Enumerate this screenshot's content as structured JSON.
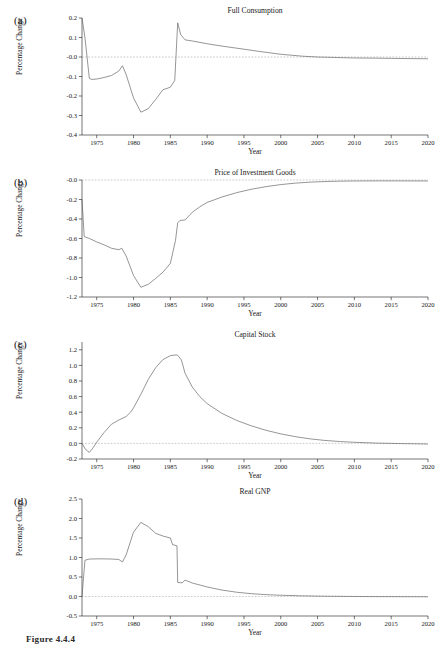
{
  "figure": {
    "caption": "Figure 4.4.4"
  },
  "panels": [
    {
      "letter": "(a)",
      "title": "Full Consumption",
      "xlabel": "Year",
      "ylabel": "Percentage Change"
    },
    {
      "letter": "(b)",
      "title": "Price of Investment Goods",
      "xlabel": "Year",
      "ylabel": "Percentage Change"
    },
    {
      "letter": "(c)",
      "title": "Capital Stock",
      "xlabel": "Year",
      "ylabel": "Percentage Change"
    },
    {
      "letter": "(d)",
      "title": "Real GNP",
      "xlabel": "Year",
      "ylabel": "Percentage Change"
    }
  ],
  "chart_data": [
    {
      "type": "line",
      "panel": "(a)",
      "title": "Full Consumption",
      "xlabel": "Year",
      "ylabel": "Percentage Change",
      "xlim": [
        1973,
        2020
      ],
      "ylim": [
        -0.4,
        0.2
      ],
      "xticks": [
        1975,
        1980,
        1985,
        1990,
        1995,
        2000,
        2005,
        2010,
        2015,
        2020
      ],
      "xticklabels": [
        "1975",
        "1980",
        "1985",
        "1990",
        "1995",
        "2000",
        "2005",
        "2010",
        "2015",
        "2020"
      ],
      "yticks": [
        0.2,
        0.1,
        -0.0,
        -0.1,
        -0.2,
        -0.3,
        -0.4
      ],
      "yticklabels": [
        "0.2",
        "0.1",
        "-0.0",
        "-0.1",
        "-0.2",
        "-0.3",
        "-0.4"
      ],
      "grid": false,
      "legend": false,
      "zero_reference_line": 0.0,
      "x": [
        1973,
        1973.4,
        1974,
        1974.3,
        1975,
        1976,
        1977,
        1978,
        1978.5,
        1979,
        1980,
        1981,
        1982,
        1983,
        1984,
        1985,
        1985.6,
        1986,
        1986.4,
        1987,
        1988,
        1990,
        1992,
        1995,
        1997,
        2000,
        2003,
        2005,
        2008,
        2010,
        2013,
        2015,
        2017,
        2020
      ],
      "y": [
        0.2,
        0.1,
        -0.11,
        -0.115,
        -0.113,
        -0.105,
        -0.095,
        -0.072,
        -0.045,
        -0.09,
        -0.21,
        -0.283,
        -0.265,
        -0.218,
        -0.168,
        -0.155,
        -0.12,
        0.175,
        0.115,
        0.088,
        0.082,
        0.068,
        0.056,
        0.04,
        0.029,
        0.014,
        0.004,
        0.0,
        -0.003,
        -0.005,
        -0.006,
        -0.007,
        -0.008,
        -0.009
      ]
    },
    {
      "type": "line",
      "panel": "(b)",
      "title": "Price of Investment Goods",
      "xlabel": "Year",
      "ylabel": "Percentage Change",
      "xlim": [
        1973,
        2020
      ],
      "ylim": [
        -1.2,
        0.0
      ],
      "xticks": [
        1975,
        1980,
        1985,
        1990,
        1995,
        2000,
        2005,
        2010,
        2015,
        2020
      ],
      "xticklabels": [
        "1975",
        "1980",
        "1985",
        "1990",
        "1995",
        "2000",
        "2005",
        "2010",
        "2015",
        "2020"
      ],
      "yticks": [
        -0.0,
        -0.2,
        -0.4,
        -0.6,
        -0.8,
        -1.0,
        -1.2
      ],
      "yticklabels": [
        "-0.0",
        "-0.2",
        "-0.4",
        "-0.6",
        "-0.8",
        "-1.0",
        "-1.2"
      ],
      "grid": false,
      "legend": false,
      "zero_reference_line": 0.0,
      "x": [
        1973,
        1973.3,
        1974,
        1975,
        1976,
        1977,
        1978,
        1978.4,
        1979,
        1980,
        1981,
        1982,
        1983,
        1984,
        1985,
        1985.7,
        1986,
        1986.3,
        1987,
        1988,
        1989,
        1990,
        1992,
        1994,
        1996,
        1998,
        2000,
        2002,
        2004,
        2006,
        2008,
        2010,
        2013,
        2016,
        2020
      ],
      "y": [
        -0.2,
        -0.58,
        -0.6,
        -0.635,
        -0.665,
        -0.7,
        -0.715,
        -0.7,
        -0.78,
        -0.98,
        -1.1,
        -1.07,
        -1.01,
        -0.945,
        -0.855,
        -0.62,
        -0.44,
        -0.415,
        -0.41,
        -0.33,
        -0.275,
        -0.23,
        -0.175,
        -0.13,
        -0.095,
        -0.068,
        -0.047,
        -0.032,
        -0.022,
        -0.016,
        -0.012,
        -0.01,
        -0.009,
        -0.009,
        -0.01
      ]
    },
    {
      "type": "line",
      "panel": "(c)",
      "title": "Capital Stock",
      "xlabel": "Year",
      "ylabel": "Percentage Change",
      "xlim": [
        1973,
        2020
      ],
      "ylim": [
        -0.2,
        1.3
      ],
      "xticks": [
        1975,
        1980,
        1985,
        1990,
        1995,
        2000,
        2005,
        2010,
        2015,
        2020
      ],
      "xticklabels": [
        "1975",
        "1980",
        "1985",
        "1990",
        "1995",
        "2000",
        "2005",
        "2010",
        "2015",
        "2020"
      ],
      "yticks": [
        1.2,
        1.0,
        0.8,
        0.6,
        0.4,
        0.2,
        0.0,
        -0.2
      ],
      "yticklabels": [
        "1.2",
        "1.0",
        "0.8",
        "0.6",
        "0.4",
        "0.2",
        "0.0",
        "-0.2"
      ],
      "grid": false,
      "legend": false,
      "zero_reference_line": 0.0,
      "x": [
        1973,
        1973.5,
        1974,
        1974.4,
        1975,
        1976,
        1977,
        1978,
        1979,
        1979.6,
        1980,
        1981,
        1982,
        1983,
        1984,
        1985,
        1985.8,
        1986,
        1986.5,
        1987,
        1988,
        1989,
        1990,
        1992,
        1994,
        1996,
        1998,
        2000,
        2002,
        2004,
        2006,
        2008,
        2010,
        2013,
        2016,
        2020
      ],
      "y": [
        0.0,
        -0.08,
        -0.115,
        -0.07,
        0.015,
        0.14,
        0.245,
        0.3,
        0.345,
        0.4,
        0.455,
        0.63,
        0.82,
        0.97,
        1.075,
        1.125,
        1.135,
        1.13,
        1.07,
        0.9,
        0.72,
        0.6,
        0.51,
        0.385,
        0.295,
        0.225,
        0.168,
        0.122,
        0.086,
        0.058,
        0.038,
        0.024,
        0.014,
        0.004,
        -0.002,
        -0.008
      ]
    },
    {
      "type": "line",
      "panel": "(d)",
      "title": "Real GNP",
      "xlabel": "Year",
      "ylabel": "Percentage Change",
      "xlim": [
        1973,
        2020
      ],
      "ylim": [
        -0.5,
        2.5
      ],
      "xticks": [
        1975,
        1980,
        1985,
        1990,
        1995,
        2000,
        2005,
        2010,
        2015,
        2020
      ],
      "xticklabels": [
        "1975",
        "1980",
        "1985",
        "1990",
        "1995",
        "2000",
        "2005",
        "2010",
        "2015",
        "2020"
      ],
      "yticks": [
        2.5,
        2.0,
        1.5,
        1.0,
        0.5,
        0.0,
        -0.5
      ],
      "yticklabels": [
        "2.5",
        "2.0",
        "1.5",
        "1.0",
        "0.5",
        "0.0",
        "-0.5"
      ],
      "grid": false,
      "legend": false,
      "zero_reference_line": 0.0,
      "x": [
        1973,
        1973.4,
        1974,
        1975,
        1976,
        1977,
        1978,
        1978.5,
        1979,
        1980,
        1981,
        1982,
        1983,
        1984,
        1985,
        1985.3,
        1985.9,
        1986,
        1986.6,
        1987,
        1988,
        1990,
        1992,
        1994,
        1996,
        1998,
        2000,
        2003,
        2006,
        2009,
        2012,
        2015,
        2018,
        2020
      ],
      "y": [
        0.0,
        0.93,
        0.96,
        0.965,
        0.965,
        0.96,
        0.95,
        0.885,
        1.07,
        1.65,
        1.9,
        1.79,
        1.62,
        1.55,
        1.5,
        1.33,
        1.3,
        0.36,
        0.35,
        0.42,
        0.345,
        0.245,
        0.165,
        0.11,
        0.072,
        0.048,
        0.032,
        0.017,
        0.008,
        0.002,
        -0.002,
        -0.004,
        -0.006,
        -0.007
      ]
    }
  ]
}
